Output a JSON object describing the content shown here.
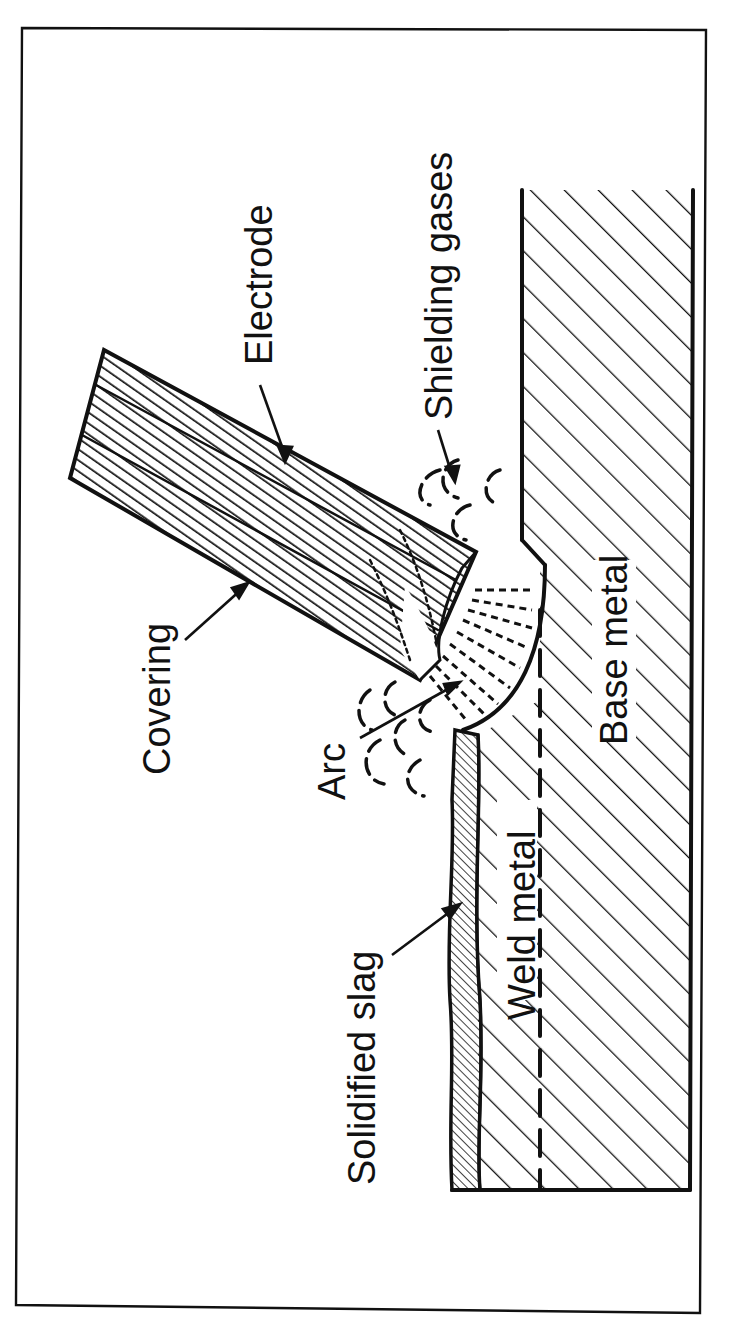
{
  "figure": {
    "orientation": "rotated 90 degrees counter-clockwise",
    "colors": {
      "ink": "#111111",
      "paper": "#ffffff"
    }
  },
  "labels": {
    "electrode": "Electrode",
    "shielding_gases": "Shielding gases",
    "covering": "Covering",
    "arc": "Arc",
    "base_metal": "Base metal",
    "weld_metal": "Weld metal",
    "solidified_slag": "Solidified slag"
  }
}
